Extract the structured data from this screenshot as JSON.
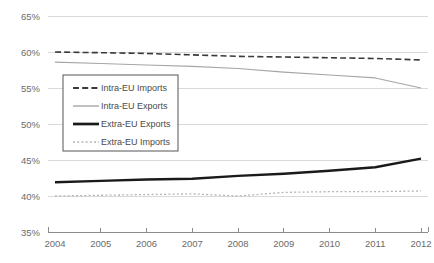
{
  "chart_data": {
    "type": "line",
    "title": "",
    "xlabel": "",
    "ylabel": "",
    "x": [
      2004,
      2005,
      2006,
      2007,
      2008,
      2009,
      2010,
      2011,
      2012
    ],
    "categories": [
      "2004",
      "2005",
      "2006",
      "2007",
      "2008",
      "2009",
      "2010",
      "2011",
      "2012"
    ],
    "ylim": [
      35,
      65
    ],
    "yticks": [
      35,
      40,
      45,
      50,
      55,
      60,
      65
    ],
    "ytick_labels": [
      "35%",
      "40%",
      "45%",
      "50%",
      "55%",
      "60%",
      "65%"
    ],
    "grid": true,
    "legend_position": "upper-left-inside",
    "series": [
      {
        "name": "Intra-EU Imports",
        "style": "dashed",
        "color": "#3a3a3a",
        "width": 1.6,
        "values": [
          60.0,
          59.9,
          59.8,
          59.6,
          59.4,
          59.3,
          59.2,
          59.1,
          58.9
        ]
      },
      {
        "name": "Intra-EU Exports",
        "style": "solid-thin",
        "color": "#a6a6a6",
        "width": 1.1,
        "values": [
          58.6,
          58.4,
          58.2,
          58.0,
          57.7,
          57.2,
          56.8,
          56.4,
          55.0
        ]
      },
      {
        "name": "Extra-EU Exports",
        "style": "solid-thick",
        "color": "#1a1a1a",
        "width": 2.4,
        "values": [
          41.9,
          42.1,
          42.3,
          42.4,
          42.8,
          43.1,
          43.5,
          44.0,
          45.2
        ]
      },
      {
        "name": "Extra-EU Imports",
        "style": "dotted",
        "color": "#b5b5b5",
        "width": 1.3,
        "values": [
          40.0,
          40.1,
          40.2,
          40.3,
          40.0,
          40.5,
          40.6,
          40.6,
          40.7
        ]
      }
    ]
  },
  "legend": {
    "items": [
      {
        "label": "Intra-EU Imports"
      },
      {
        "label": "Intra-EU Exports"
      },
      {
        "label": "Extra-EU Exports"
      },
      {
        "label": "Extra-EU Imports"
      }
    ]
  },
  "colors": {
    "grid": "#d9d9d9",
    "axis": "#8c8c8c",
    "tick_text": "#6b6b6b",
    "legend_border": "#555555",
    "background": "#ffffff"
  }
}
